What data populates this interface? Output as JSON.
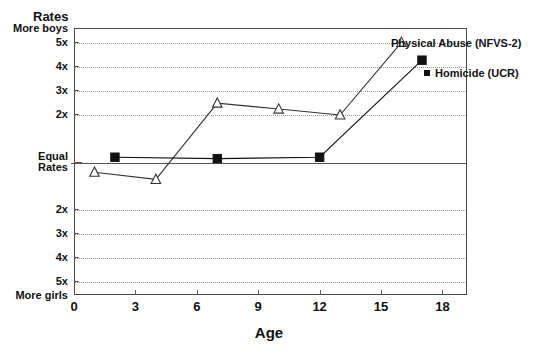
{
  "chart_data": {
    "type": "line",
    "title": "",
    "ylabel": "Rates",
    "xlabel": "Age",
    "xlim": [
      0,
      19.2
    ],
    "ylim": [
      -5.6,
      5.6
    ],
    "grid": true,
    "legend_position": "inside-upper-right",
    "x_ticks": [
      "0",
      "3",
      "6",
      "9",
      "12",
      "15",
      "18"
    ],
    "x_tick_values": [
      0,
      3,
      6,
      9,
      12,
      15,
      18
    ],
    "y_ticks": [
      "More boys",
      "5x",
      "4x",
      "3x",
      "2x",
      "Equal\nRates",
      "2x",
      "3x",
      "4x",
      "5x",
      "More girls"
    ],
    "y_tick_values": [
      5.6,
      5,
      4,
      3,
      2,
      0,
      -2,
      -3,
      -4,
      -5,
      -5.6
    ],
    "y_axis_top_label": "More boys",
    "y_axis_bottom_label": "More girls",
    "y_axis_zero_label_line1": "Equal",
    "y_axis_zero_label_line2": "Rates",
    "series": [
      {
        "name": "Physical Abuse (NFVS-2)",
        "marker": "triangle",
        "color": "#333333",
        "points": [
          {
            "x": 1,
            "y": -0.45
          },
          {
            "x": 4,
            "y": -0.75
          },
          {
            "x": 7,
            "y": 2.45
          },
          {
            "x": 10,
            "y": 2.2
          },
          {
            "x": 13,
            "y": 1.95
          },
          {
            "x": 16,
            "y": 5.0
          }
        ]
      },
      {
        "name": "Homicide (UCR)",
        "marker": "square",
        "color": "#111111",
        "points": [
          {
            "x": 2,
            "y": 0.18
          },
          {
            "x": 7,
            "y": 0.12
          },
          {
            "x": 12,
            "y": 0.18
          },
          {
            "x": 17,
            "y": 4.25
          }
        ]
      }
    ]
  },
  "legend": {
    "abuse_label": "Physical Abuse (NFVS-2)",
    "homicide_label": "Homicide (UCR)"
  },
  "axes": {
    "y_title": "Rates",
    "x_title": "Age"
  }
}
